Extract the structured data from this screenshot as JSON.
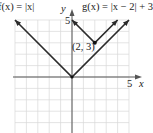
{
  "chart_data": {
    "type": "line",
    "title": "",
    "xlabel": "x",
    "ylabel": "y",
    "xlim": [
      -5,
      5
    ],
    "ylim": [
      -5,
      5
    ],
    "grid": true,
    "tick_labels": {
      "x": [
        "5"
      ],
      "y": [
        "5"
      ]
    },
    "series": [
      {
        "name": "f(x) = |x|",
        "points": [
          [
            -5,
            5
          ],
          [
            0,
            0
          ],
          [
            5,
            5
          ]
        ],
        "color": "#2b2b2b"
      },
      {
        "name": "g(x) = |x − 2| + 3",
        "points": [
          [
            0,
            5
          ],
          [
            2,
            3
          ],
          [
            4,
            5
          ]
        ],
        "color": "#2b2b2b"
      }
    ],
    "annotations": [
      {
        "text": "(2, 3)",
        "x": 2,
        "y": 3
      }
    ]
  },
  "labels": {
    "f_label": "f(x) = |x|",
    "g_label": "g(x) = |x − 2| + 3",
    "vertex_label": "(2, 3)",
    "x_axis_label": "x",
    "y_axis_label": "y",
    "x_tick": "5",
    "y_tick": "5"
  },
  "colors": {
    "grid": "#d4d4d4",
    "axis": "#555555",
    "curve": "#2b2b2b"
  }
}
